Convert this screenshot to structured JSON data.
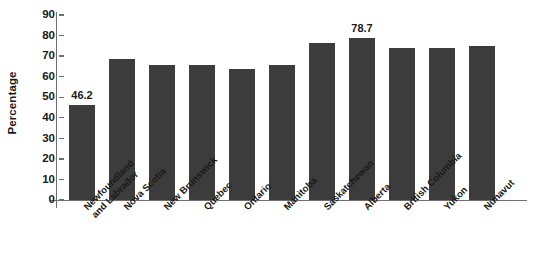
{
  "chart_data": {
    "type": "bar",
    "title": "",
    "xlabel": "",
    "ylabel": "Percentage",
    "ylim": [
      0,
      90
    ],
    "yticks": [
      0,
      10,
      20,
      30,
      40,
      50,
      60,
      70,
      80,
      90
    ],
    "grid": false,
    "legend": "none",
    "bar_color": "#3c3c3c",
    "axis_color": "#6f6f6f",
    "categories": [
      "Newfoundland and Labrador",
      "Nova Scotia",
      "New Brunswick",
      "Quebec",
      "Ontario",
      "Manitoba",
      "Saskatchewan",
      "Alberta",
      "British Columbia",
      "Yukon",
      "Nunavut"
    ],
    "category_lines": [
      [
        "Newfoundland",
        "and Labrador"
      ],
      [
        "Nova Scotia"
      ],
      [
        "New Brunswick"
      ],
      [
        "Quebec"
      ],
      [
        "Ontario"
      ],
      [
        "Manitoba"
      ],
      [
        "Saskatchewan"
      ],
      [
        "Alberta"
      ],
      [
        "British Columbia"
      ],
      [
        "Yukon"
      ],
      [
        "Nunavut"
      ]
    ],
    "values": [
      46.2,
      68.5,
      65.5,
      65.5,
      63.5,
      65.5,
      76.5,
      78.7,
      74.0,
      74.0,
      75.0
    ],
    "data_labels": [
      {
        "index": 0,
        "text": "46.2"
      },
      {
        "index": 7,
        "text": "78.7"
      }
    ]
  }
}
